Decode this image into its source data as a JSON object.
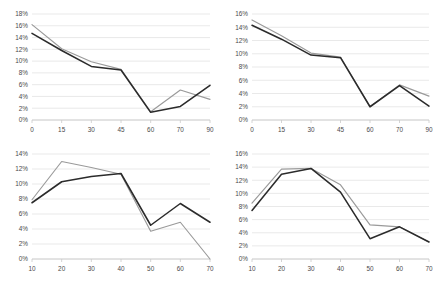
{
  "figure": {
    "background": "#ffffff",
    "layout": "2x2 grid of line charts",
    "colors": {
      "series_dark": "#2b2b2b",
      "series_light": "#9a9a9a",
      "gridline": "#dfdfdf",
      "axis": "#c9c9c9",
      "tick_label": "#4a4a4a"
    }
  },
  "chart_data": [
    {
      "id": "top-left",
      "type": "line",
      "title": "",
      "xlabel": "",
      "ylabel": "",
      "x": [
        0,
        15,
        30,
        45,
        60,
        70,
        90
      ],
      "xtick_labels": [
        "0",
        "15",
        "30",
        "45",
        "60",
        "70",
        "90"
      ],
      "ytick_labels": [
        "0%",
        "2%",
        "4%",
        "6%",
        "8%",
        "10%",
        "12%",
        "14%",
        "16%",
        "18%"
      ],
      "ytick_values": [
        0,
        2,
        4,
        6,
        8,
        10,
        12,
        14,
        16,
        18
      ],
      "ylim": [
        0,
        18
      ],
      "grid": true,
      "legend": "none",
      "series": [
        {
          "name": "series-light",
          "color": "#9a9a9a",
          "values": [
            16.2,
            12.1,
            9.9,
            8.6,
            1.4,
            5.1,
            3.5
          ]
        },
        {
          "name": "series-dark",
          "color": "#2b2b2b",
          "values": [
            14.7,
            11.8,
            9.1,
            8.5,
            1.3,
            2.3,
            5.9
          ]
        }
      ]
    },
    {
      "id": "top-right",
      "type": "line",
      "title": "",
      "xlabel": "",
      "ylabel": "",
      "x": [
        0,
        15,
        30,
        45,
        60,
        70,
        90
      ],
      "xtick_labels": [
        "0",
        "15",
        "30",
        "45",
        "60",
        "70",
        "90"
      ],
      "ytick_labels": [
        "0%",
        "2%",
        "4%",
        "6%",
        "8%",
        "10%",
        "12%",
        "14%",
        "16%"
      ],
      "ytick_values": [
        0,
        2,
        4,
        6,
        8,
        10,
        12,
        14,
        16
      ],
      "ylim": [
        0,
        16
      ],
      "grid": true,
      "legend": "none",
      "series": [
        {
          "name": "series-light",
          "color": "#9a9a9a",
          "values": [
            15.1,
            12.7,
            10.1,
            9.5,
            2.0,
            5.3,
            3.6
          ]
        },
        {
          "name": "series-dark",
          "color": "#2b2b2b",
          "values": [
            14.3,
            12.2,
            9.8,
            9.4,
            2.0,
            5.2,
            2.1
          ]
        }
      ]
    },
    {
      "id": "bottom-left",
      "type": "line",
      "title": "",
      "xlabel": "",
      "ylabel": "",
      "x": [
        10,
        20,
        30,
        40,
        50,
        60,
        70
      ],
      "xtick_labels": [
        "10",
        "20",
        "30",
        "40",
        "50",
        "60",
        "70"
      ],
      "ytick_labels": [
        "0%",
        "2%",
        "4%",
        "6%",
        "8%",
        "10%",
        "12%",
        "14%"
      ],
      "ytick_values": [
        0,
        2,
        4,
        6,
        8,
        10,
        12,
        14
      ],
      "ylim": [
        0,
        14
      ],
      "grid": true,
      "legend": "none",
      "series": [
        {
          "name": "series-light",
          "color": "#9a9a9a",
          "values": [
            7.9,
            13.0,
            12.2,
            11.3,
            3.7,
            4.9,
            0.0
          ]
        },
        {
          "name": "series-dark",
          "color": "#2b2b2b",
          "values": [
            7.5,
            10.3,
            11.0,
            11.4,
            4.5,
            7.4,
            4.9
          ]
        }
      ]
    },
    {
      "id": "bottom-right",
      "type": "line",
      "title": "",
      "xlabel": "",
      "ylabel": "",
      "x": [
        10,
        20,
        30,
        40,
        50,
        60,
        70
      ],
      "xtick_labels": [
        "10",
        "20",
        "30",
        "40",
        "50",
        "60",
        "70"
      ],
      "ytick_labels": [
        "0%",
        "2%",
        "4%",
        "6%",
        "8%",
        "10%",
        "12%",
        "14%",
        "16%"
      ],
      "ytick_values": [
        0,
        2,
        4,
        6,
        8,
        10,
        12,
        14,
        16
      ],
      "ylim": [
        0,
        16
      ],
      "grid": true,
      "legend": "none",
      "series": [
        {
          "name": "series-light",
          "color": "#9a9a9a",
          "values": [
            8.5,
            13.7,
            13.8,
            11.3,
            5.2,
            4.9,
            2.6
          ]
        },
        {
          "name": "series-dark",
          "color": "#2b2b2b",
          "values": [
            7.4,
            12.9,
            13.8,
            10.2,
            3.1,
            4.9,
            2.6
          ]
        }
      ]
    }
  ]
}
